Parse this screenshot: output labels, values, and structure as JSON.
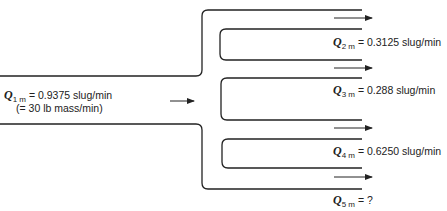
{
  "diagram": {
    "type": "flow-manifold",
    "inlet": {
      "symbol": "Q",
      "subscript": "1 m",
      "value_text": "= 0.9375 slug/min",
      "note": "(= 30 lb mass/min)"
    },
    "outlets": [
      {
        "symbol": "Q",
        "subscript": "2 m",
        "value_text": "= 0.3125 slug/min"
      },
      {
        "symbol": "Q",
        "subscript": "3 m",
        "value_text": "= 0.288 slug/min"
      },
      {
        "symbol": "Q",
        "subscript": "4 m",
        "value_text": "= 0.6250 slug/min"
      },
      {
        "symbol": "Q",
        "subscript": "5 m",
        "value_text": "= ?"
      }
    ],
    "colors": {
      "line": "#222222",
      "background": "#ffffff"
    }
  }
}
